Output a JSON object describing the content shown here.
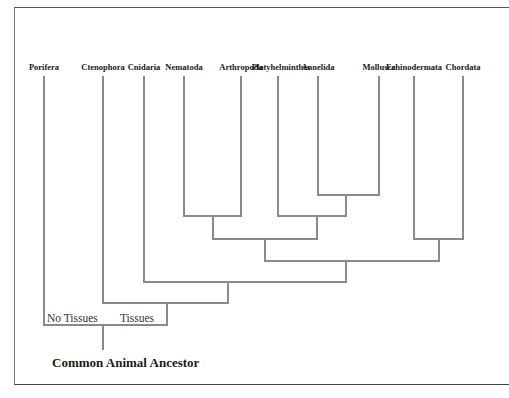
{
  "diagram": {
    "type": "cladogram",
    "root_label": "Common Animal Ancestor",
    "branch_labels": {
      "no_tissues": "No Tissues",
      "tissues": "Tissues"
    },
    "taxa": [
      {
        "name": "Porifera",
        "x": 44
      },
      {
        "name": "Ctenophora",
        "x": 103
      },
      {
        "name": "Cnidaria",
        "x": 144
      },
      {
        "name": "Nematoda",
        "x": 184
      },
      {
        "name": "Arthropoda",
        "x": 241
      },
      {
        "name": "Platyhelminthes",
        "x": 278
      },
      {
        "name": "Annelida",
        "x": 318
      },
      {
        "name": "Mollusca",
        "x": 379
      },
      {
        "name": "Echinodermata",
        "x": 414
      },
      {
        "name": "Chordata",
        "x": 463
      }
    ],
    "clades": [
      {
        "members": [
          "Annelida",
          "Mollusca"
        ]
      },
      {
        "members": [
          "Nematoda",
          "Arthropoda"
        ]
      },
      {
        "members": [
          "Platyhelminthes",
          "Annelida",
          "Mollusca"
        ]
      },
      {
        "members": [
          "Echinodermata",
          "Chordata"
        ]
      },
      {
        "members": [
          "Nematoda",
          "Arthropoda",
          "Platyhelminthes",
          "Annelida",
          "Mollusca"
        ]
      },
      {
        "members": [
          "Nematoda",
          "Arthropoda",
          "Platyhelminthes",
          "Annelida",
          "Mollusca",
          "Echinodermata",
          "Chordata"
        ]
      },
      {
        "members": [
          "Cnidaria",
          "Nematoda",
          "Arthropoda",
          "Platyhelminthes",
          "Annelida",
          "Mollusca",
          "Echinodermata",
          "Chordata"
        ]
      },
      {
        "members": [
          "Ctenophora",
          "Cnidaria",
          "Nematoda",
          "Arthropoda",
          "Platyhelminthes",
          "Annelida",
          "Mollusca",
          "Echinodermata",
          "Chordata"
        ],
        "label": "Tissues"
      },
      {
        "members": [
          "Porifera"
        ],
        "label": "No Tissues"
      }
    ],
    "line_color": "#8a8a8a"
  }
}
